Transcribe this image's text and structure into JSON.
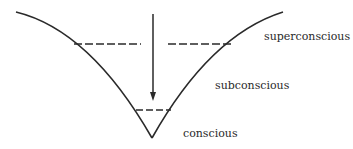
{
  "diagram": {
    "type": "consciousness-funnel",
    "labels": {
      "superconscious": "superconscious",
      "subconscious": "subconscious",
      "conscious": "conscious"
    },
    "colors": {
      "stroke": "#2a2a2a",
      "background": "#ffffff"
    },
    "elements": {
      "funnel_curve": "V-shaped curved funnel",
      "downward_arrow": "vertical arrow pointing down into funnel",
      "upper_dashed_divider": "dashed line separating superconscious and subconscious",
      "lower_dashed_divider": "dashed line separating subconscious and conscious"
    }
  }
}
